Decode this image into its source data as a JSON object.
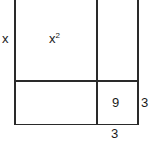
{
  "diagram": {
    "title": "",
    "labels": {
      "side_x": "x",
      "area_x2_base": "x",
      "area_x2_exp": "2",
      "area_9": "9",
      "side_3_right": "3",
      "side_3_bottom": "3"
    },
    "line_color": "#2a2a2a"
  }
}
